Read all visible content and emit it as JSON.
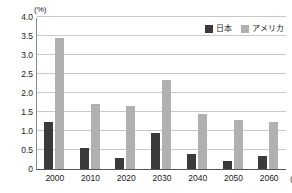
{
  "chart_data": {
    "type": "bar",
    "title": "",
    "subtitle": "",
    "xlabel": "年",
    "ylabel": "(%)",
    "unit_label": "(%)",
    "categories": [
      "2000",
      "2010",
      "2020",
      "2030",
      "2040",
      "2050",
      "2060"
    ],
    "series": [
      {
        "name": "日本",
        "color": "#3a3a3a",
        "values": [
          1.25,
          0.55,
          0.3,
          0.95,
          0.4,
          0.2,
          0.35
        ]
      },
      {
        "name": "アメリカ",
        "color": "#b0b0b0",
        "values": [
          3.45,
          1.7,
          1.65,
          2.35,
          1.45,
          1.3,
          1.25
        ]
      }
    ],
    "ylim": [
      0,
      4.0
    ],
    "yticks": [
      "0",
      "0.5",
      "1.0",
      "1.5",
      "2.0",
      "2.5",
      "3.0",
      "3.5",
      "4.0"
    ],
    "ytick_values": [
      0,
      0.5,
      1.0,
      1.5,
      2.0,
      2.5,
      3.0,
      3.5,
      4.0
    ],
    "grid": true,
    "legend_position": "top-right"
  },
  "legend": {
    "entries": [
      {
        "label": "日本",
        "color": "#3a3a3a"
      },
      {
        "label": "アメリカ",
        "color": "#b0b0b0"
      }
    ]
  },
  "axis": {
    "x_unit": "(年)"
  },
  "colors": {
    "japan": "#3a3a3a",
    "america": "#b0b0b0",
    "gridline": "#c9c9c9",
    "axis": "#555555",
    "text": "#1a1a1a"
  }
}
